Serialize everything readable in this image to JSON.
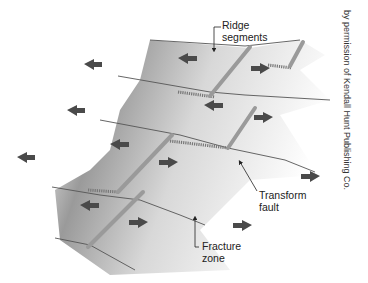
{
  "figure": {
    "labels": {
      "ridge": {
        "line1": "Ridge",
        "line2": "segments"
      },
      "transform": {
        "line1": "Transform",
        "line2": "fault"
      },
      "fracture": {
        "line1": "Fracture",
        "line2": "zone"
      }
    },
    "credit": "by permission of Kendall Hunt Publishing Co.",
    "colors": {
      "arrow": "#4a4a4a",
      "plate_dark": "#8c8c8c",
      "plate_light": "#f2f2f2",
      "ridge": "#9a9a9a",
      "line": "#444444"
    }
  }
}
